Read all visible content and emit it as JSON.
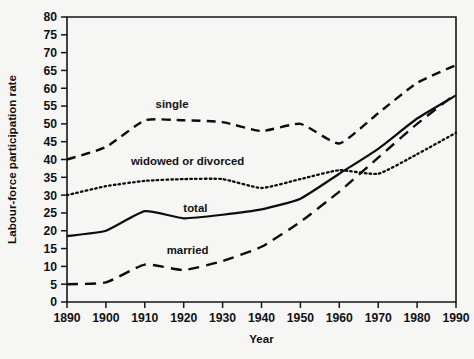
{
  "chart_data": {
    "type": "line",
    "title": "",
    "xlabel": "Year",
    "ylabel": "Labour-force participation rate",
    "xlim": [
      1890,
      1990
    ],
    "ylim": [
      0,
      80
    ],
    "xticks": [
      1890,
      1900,
      1910,
      1920,
      1930,
      1940,
      1950,
      1960,
      1970,
      1980,
      1990
    ],
    "yticks": [
      0,
      5,
      10,
      15,
      20,
      25,
      30,
      35,
      40,
      45,
      50,
      55,
      60,
      65,
      70,
      75,
      80
    ],
    "grid": false,
    "legend_position": "inline-labels",
    "x": [
      1890,
      1900,
      1910,
      1920,
      1930,
      1940,
      1950,
      1960,
      1970,
      1980,
      1990
    ],
    "series": [
      {
        "name": "single",
        "label": "single",
        "style": "dashed",
        "label_x": 1917,
        "label_y": 55.5,
        "values": [
          40.0,
          43.5,
          51.0,
          51.0,
          50.5,
          48.0,
          50.0,
          44.5,
          53.0,
          61.5,
          66.5
        ]
      },
      {
        "name": "widowed or divorced",
        "label": "widowed or divorced",
        "style": "dotted",
        "label_x": 1921,
        "label_y": 39.5,
        "values": [
          30.0,
          32.5,
          34.0,
          34.5,
          34.5,
          32.0,
          34.5,
          37.0,
          36.0,
          41.5,
          47.5
        ]
      },
      {
        "name": "total",
        "label": "total",
        "style": "solid",
        "label_x": 1923,
        "label_y": 26.5,
        "values": [
          18.5,
          20.0,
          25.5,
          23.5,
          24.5,
          26.0,
          29.0,
          36.0,
          43.0,
          51.5,
          58.0
        ]
      },
      {
        "name": "married",
        "label": "married",
        "style": "long-dashed",
        "label_x": 1921,
        "label_y": 14.5,
        "values": [
          5.0,
          5.5,
          10.5,
          9.0,
          11.5,
          15.5,
          22.5,
          31.0,
          40.5,
          50.0,
          58.5
        ]
      }
    ],
    "colors": {
      "axis": "#16161a",
      "lines": "#0c0c0f",
      "background": "#f6f6f4"
    }
  },
  "layout": {
    "plot_left": 67,
    "plot_right": 456,
    "plot_top": 17,
    "plot_bottom": 302
  }
}
